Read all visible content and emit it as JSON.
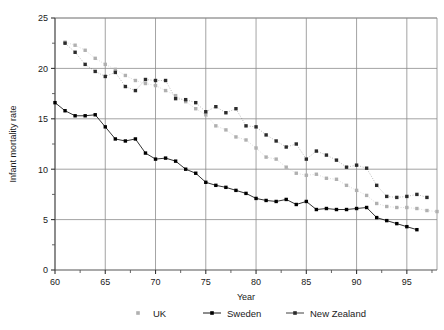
{
  "chart_data": {
    "type": "scatter",
    "title": "",
    "xlabel": "Year",
    "ylabel": "Infant mortality rate",
    "xlim": [
      60,
      98
    ],
    "ylim": [
      0,
      25
    ],
    "xticks": [
      60,
      65,
      70,
      75,
      80,
      85,
      90,
      95
    ],
    "xtick_labels": [
      "60",
      "65",
      "70",
      "75",
      "80",
      "85",
      "90",
      "95"
    ],
    "yticks": [
      0,
      5,
      10,
      15,
      20,
      25
    ],
    "ytick_labels": [
      "0",
      "5",
      "10",
      "15",
      "20",
      "25"
    ],
    "x_minor_step": 2.5,
    "y_minor_step": 2.5,
    "grid": "major-xy",
    "legend_position": "bottom",
    "series": [
      {
        "name": "UK",
        "color": "#b0b0b0",
        "marker": "square",
        "line": "dotted",
        "x": [
          61,
          62,
          63,
          64,
          65,
          66,
          67,
          68,
          69,
          70,
          71,
          72,
          73,
          74,
          75,
          76,
          77,
          78,
          79,
          80,
          81,
          82,
          83,
          84,
          85,
          86,
          87,
          88,
          89,
          90,
          91,
          92,
          93,
          94,
          95,
          96,
          97,
          98
        ],
        "y": [
          22.6,
          22.3,
          21.8,
          21.0,
          20.4,
          19.9,
          19.3,
          18.8,
          18.5,
          18.3,
          17.8,
          17.3,
          16.7,
          16.0,
          15.4,
          14.3,
          13.9,
          13.2,
          12.9,
          12.1,
          11.2,
          11.0,
          10.2,
          9.6,
          9.4,
          9.5,
          9.1,
          9.0,
          8.4,
          7.9,
          7.4,
          6.6,
          6.3,
          6.2,
          6.2,
          6.1,
          5.9,
          5.8
        ]
      },
      {
        "name": "Sweden",
        "color": "#000000",
        "marker": "square",
        "line": "solid",
        "x": [
          60,
          61,
          62,
          63,
          64,
          65,
          66,
          67,
          68,
          69,
          70,
          71,
          72,
          73,
          74,
          75,
          76,
          77,
          78,
          79,
          80,
          81,
          82,
          83,
          84,
          85,
          86,
          87,
          88,
          89,
          90,
          91,
          92,
          93,
          94,
          95,
          96
        ],
        "y": [
          16.6,
          15.8,
          15.3,
          15.3,
          15.4,
          14.2,
          13.0,
          12.8,
          13.0,
          11.6,
          11.0,
          11.1,
          10.8,
          10.0,
          9.6,
          8.7,
          8.4,
          8.2,
          7.9,
          7.6,
          7.1,
          6.9,
          6.8,
          7.0,
          6.5,
          6.8,
          6.0,
          6.1,
          6.0,
          6.0,
          6.1,
          6.2,
          5.2,
          4.9,
          4.6,
          4.3,
          4.0
        ]
      },
      {
        "name": "New Zealand",
        "color": "#2b2b2b",
        "marker": "square",
        "line": "dotted",
        "x": [
          61,
          62,
          63,
          64,
          65,
          66,
          67,
          68,
          69,
          70,
          71,
          72,
          73,
          74,
          75,
          76,
          77,
          78,
          79,
          80,
          81,
          82,
          83,
          84,
          85,
          86,
          87,
          88,
          89,
          90,
          91,
          92,
          93,
          94,
          95,
          96,
          97
        ],
        "y": [
          22.5,
          21.6,
          20.4,
          19.7,
          19.2,
          19.6,
          18.2,
          17.8,
          18.9,
          18.8,
          18.8,
          17.0,
          16.9,
          16.6,
          15.7,
          16.2,
          15.6,
          16.0,
          14.3,
          14.2,
          13.4,
          12.8,
          12.2,
          12.5,
          11.0,
          11.8,
          11.4,
          10.9,
          10.2,
          10.4,
          10.1,
          8.4,
          7.3,
          7.2,
          7.3,
          7.5,
          7.2
        ]
      }
    ],
    "legend": [
      {
        "label": "UK",
        "color": "#b0b0b0",
        "has_line": false
      },
      {
        "label": "Sweden",
        "color": "#000000",
        "has_line": true
      },
      {
        "label": "New Zealand",
        "color": "#2b2b2b",
        "has_line": true
      }
    ]
  },
  "axes": {
    "x_title": "Year",
    "y_title": "Infant mortality rate"
  }
}
